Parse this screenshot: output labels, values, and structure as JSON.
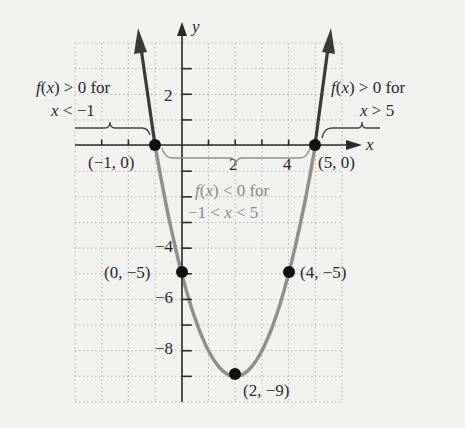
{
  "chart_data": {
    "type": "line",
    "title": "",
    "function": "f(x) = x^2 - 4x - 5",
    "xlabel": "x",
    "ylabel": "y",
    "xlim": [
      -4,
      6
    ],
    "ylim": [
      -10,
      4
    ],
    "grid": true,
    "x_ticks": [
      {
        "value": 2,
        "label": "2"
      },
      {
        "value": 4,
        "label": "4"
      }
    ],
    "y_ticks": [
      {
        "value": 2,
        "label": "2"
      },
      {
        "value": -4,
        "label": "-4"
      },
      {
        "value": -6,
        "label": "-6"
      },
      {
        "value": -8,
        "label": "-8"
      }
    ],
    "series": [
      {
        "name": "f(x) > 0 for x < -1",
        "style": "dark arrow",
        "x": [
          -1,
          -1.6
        ],
        "y": [
          0,
          4.36
        ]
      },
      {
        "name": "f(x) < 0 for -1 < x < 5",
        "style": "gray curve",
        "x": [
          -1,
          0,
          1,
          2,
          3,
          4,
          5
        ],
        "y": [
          0,
          -5,
          -8,
          -9,
          -8,
          -5,
          0
        ]
      },
      {
        "name": "f(x) > 0 for x > 5",
        "style": "dark arrow",
        "x": [
          5,
          5.6
        ],
        "y": [
          0,
          4.36
        ]
      }
    ],
    "points": [
      {
        "x": -1,
        "y": 0,
        "label": "(−1, 0)"
      },
      {
        "x": 5,
        "y": 0,
        "label": "(5, 0)"
      },
      {
        "x": 0,
        "y": -5,
        "label": "(0, −5)"
      },
      {
        "x": 4,
        "y": -5,
        "label": "(4, −5)"
      },
      {
        "x": 2,
        "y": -9,
        "label": "(2, −9)"
      }
    ],
    "annotations": [
      {
        "line1": "f(x) > 0 for",
        "line2": "x < −1",
        "region": "left"
      },
      {
        "line1": "f(x) > 0 for",
        "line2": "x > 5",
        "region": "right"
      },
      {
        "line1": "f(x) < 0 for",
        "line2": "−1 < x < 5",
        "region": "middle"
      }
    ]
  },
  "labels": {
    "axis_x": "x",
    "axis_y": "y",
    "tick_x_2": "2",
    "tick_x_4": "4",
    "tick_y_2": "2",
    "tick_y_n4": "−4",
    "tick_y_n6": "−6",
    "tick_y_n8": "−8",
    "pt_m1_0": "(−1, 0)",
    "pt_5_0": "(5, 0)",
    "pt_0_m5": "(0, −5)",
    "pt_4_m5": "(4, −5)",
    "pt_2_m9": "(2, −9)",
    "left_l1": "f(x) > 0 for",
    "left_l2": "x < −1",
    "right_l1": "f(x) > 0 for",
    "right_l2": "x > 5",
    "mid_l1": "f(x) < 0 for",
    "mid_l2": "−1 < x < 5"
  },
  "colors": {
    "curve_negative": "#8f8f8f",
    "curve_positive": "#3a3a3a",
    "axis": "#2a2a2a",
    "grid": "#b8b8b8",
    "points": "#111111",
    "background": "#f1f1f0"
  }
}
